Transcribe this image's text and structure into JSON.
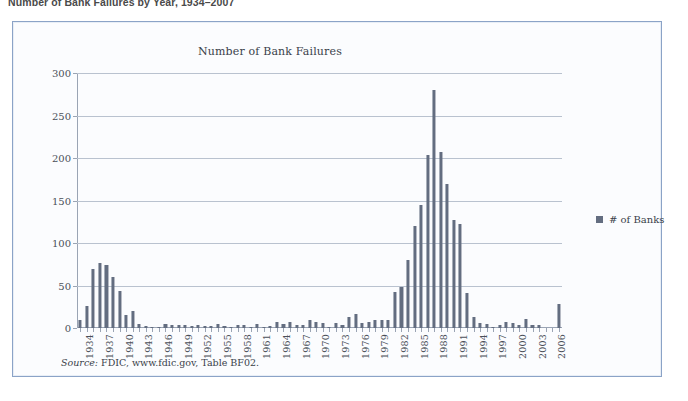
{
  "figure": {
    "caption": "Number of Bank Failures by Year, 1934–2007",
    "source_label": "Source:",
    "source_text": " FDIC, www.fdic.gov, Table BF02."
  },
  "legend": {
    "series_label": "# of Banks",
    "swatch_color": "#636d80"
  },
  "colors": {
    "bar": "#636d80",
    "panel_border": "#8ba3c7",
    "panel_background": "#fbfcfe",
    "gridline": "#b9c2cf",
    "axis": "#9aa4b4",
    "text": "#3a3f4a"
  },
  "chart_data": {
    "type": "bar",
    "title": "Number of Bank Failures",
    "xlabel": "",
    "ylabel": "",
    "ylim": [
      0,
      300
    ],
    "yticks": [
      0,
      50,
      100,
      150,
      200,
      250,
      300
    ],
    "grid": true,
    "legend_position": "right",
    "xtick_labels": [
      "1934",
      "1937",
      "1940",
      "1943",
      "1946",
      "1949",
      "1952",
      "1955",
      "1958",
      "1961",
      "1964",
      "1967",
      "1970",
      "1973",
      "1976",
      "1979",
      "1982",
      "1985",
      "1988",
      "1991",
      "1994",
      "1997",
      "2000",
      "2003",
      "2006"
    ],
    "xtick_step": 3,
    "series": [
      {
        "name": "# of Banks",
        "categories": [
          1934,
          1935,
          1936,
          1937,
          1938,
          1939,
          1940,
          1941,
          1942,
          1943,
          1944,
          1945,
          1946,
          1947,
          1948,
          1949,
          1950,
          1951,
          1952,
          1953,
          1954,
          1955,
          1956,
          1957,
          1958,
          1959,
          1960,
          1961,
          1962,
          1963,
          1964,
          1965,
          1966,
          1967,
          1968,
          1969,
          1970,
          1971,
          1972,
          1973,
          1974,
          1975,
          1976,
          1977,
          1978,
          1979,
          1980,
          1981,
          1982,
          1983,
          1984,
          1985,
          1986,
          1987,
          1988,
          1989,
          1990,
          1991,
          1992,
          1993,
          1994,
          1995,
          1996,
          1997,
          1998,
          1999,
          2000,
          2001,
          2002,
          2003,
          2004,
          2005,
          2006,
          2007
        ],
        "values": [
          9,
          26,
          69,
          76,
          74,
          60,
          43,
          15,
          20,
          5,
          2,
          1,
          1,
          5,
          3,
          4,
          4,
          2,
          3,
          2,
          2,
          5,
          2,
          1,
          4,
          3,
          1,
          5,
          1,
          2,
          7,
          5,
          7,
          4,
          3,
          9,
          7,
          6,
          1,
          6,
          4,
          13,
          16,
          6,
          7,
          10,
          10,
          10,
          42,
          48,
          80,
          120,
          145,
          203,
          280,
          207,
          169,
          127,
          122,
          41,
          13,
          6,
          5,
          1,
          3,
          7,
          6,
          4,
          11,
          3,
          4,
          0,
          0,
          28
        ]
      }
    ]
  }
}
